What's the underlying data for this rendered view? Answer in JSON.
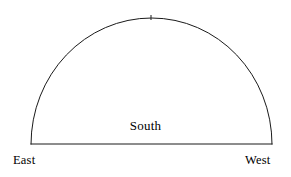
{
  "canvas": {
    "width": 291,
    "height": 177,
    "background_color": "#ffffff"
  },
  "diagram": {
    "type": "half-ellipse-dome",
    "stroke_color": "#1a1a1a",
    "stroke_width": 1,
    "fill": "none",
    "geometry": {
      "baseline_y": 144,
      "baseline_left_x": 31,
      "baseline_right_x": 272,
      "apex_x": 151,
      "apex_y": 18,
      "radius_x": 120.5,
      "radius_y": 126
    },
    "apex_tick": {
      "present": true,
      "x": 151,
      "top_y": 15,
      "bottom_y": 20
    }
  },
  "labels": {
    "south": "South",
    "east": "East",
    "west": "West"
  }
}
